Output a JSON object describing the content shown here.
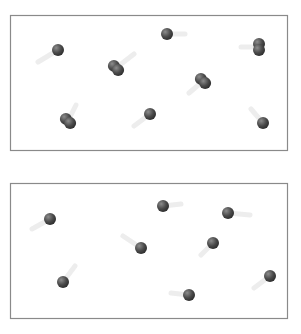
{
  "diagram": {
    "colors": {
      "border": "#8a8a8a",
      "atom_dark": "#2e2e2e",
      "atom_light": "#8c8c8c",
      "trail": "#e6e6e6"
    },
    "panels": [
      {
        "name": "top-container",
        "box": {
          "x": 10,
          "y": 15,
          "w": 277,
          "h": 135
        },
        "particles": [
          {
            "type": "atom",
            "x": 58,
            "y": 50,
            "trail_dx": -20,
            "trail_dy": 12
          },
          {
            "type": "atom",
            "x": 167,
            "y": 34,
            "trail_dx": 18,
            "trail_dy": 0
          },
          {
            "type": "dimer",
            "x": 116,
            "y": 68,
            "angle": 45,
            "trail_dx": 18,
            "trail_dy": -14
          },
          {
            "type": "dimer",
            "x": 259,
            "y": 47,
            "angle": 90,
            "trail_dx": -18,
            "trail_dy": 0
          },
          {
            "type": "dimer",
            "x": 203,
            "y": 81,
            "angle": 45,
            "trail_dx": -14,
            "trail_dy": 12
          },
          {
            "type": "dimer",
            "x": 68,
            "y": 121,
            "angle": 45,
            "trail_dx": 8,
            "trail_dy": -16
          },
          {
            "type": "atom",
            "x": 150,
            "y": 114,
            "trail_dx": -16,
            "trail_dy": 12
          },
          {
            "type": "atom",
            "x": 263,
            "y": 123,
            "trail_dx": -12,
            "trail_dy": -14
          }
        ]
      },
      {
        "name": "bottom-container",
        "box": {
          "x": 10,
          "y": 183,
          "w": 277,
          "h": 135
        },
        "particles": [
          {
            "type": "atom",
            "x": 50,
            "y": 219,
            "trail_dx": -18,
            "trail_dy": 10
          },
          {
            "type": "atom",
            "x": 163,
            "y": 206,
            "trail_dx": 18,
            "trail_dy": -2
          },
          {
            "type": "atom",
            "x": 228,
            "y": 213,
            "trail_dx": 22,
            "trail_dy": 2
          },
          {
            "type": "atom",
            "x": 141,
            "y": 248,
            "trail_dx": -18,
            "trail_dy": -12
          },
          {
            "type": "atom",
            "x": 213,
            "y": 243,
            "trail_dx": -12,
            "trail_dy": 12
          },
          {
            "type": "atom",
            "x": 63,
            "y": 282,
            "trail_dx": 12,
            "trail_dy": -16
          },
          {
            "type": "atom",
            "x": 189,
            "y": 295,
            "trail_dx": -18,
            "trail_dy": -2
          },
          {
            "type": "atom",
            "x": 270,
            "y": 276,
            "trail_dx": -16,
            "trail_dy": 12
          }
        ]
      }
    ]
  }
}
